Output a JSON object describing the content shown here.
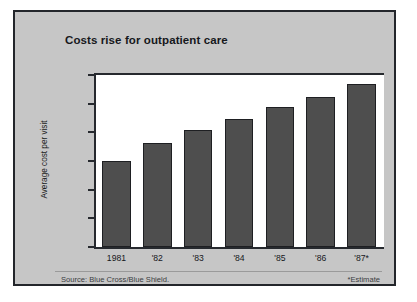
{
  "chart_data": {
    "type": "bar",
    "title": "Costs rise for outpatient care",
    "xlabel": "",
    "ylabel": "Average cost per visit",
    "categories": [
      "1981",
      "'82",
      "'83",
      "'84",
      "'85",
      "'86",
      "'87*"
    ],
    "values": [
      75,
      91,
      102,
      112,
      122,
      131,
      142
    ],
    "ylim": [
      0,
      150
    ],
    "yticks": [
      0,
      25,
      50,
      75,
      100,
      125,
      150
    ],
    "ytick_labels": [
      "0",
      "25",
      "50",
      "75",
      "100",
      "125",
      "150"
    ],
    "grid": false,
    "legend": "none",
    "series": [
      {
        "name": "Average cost per visit",
        "values": [
          75,
          91,
          102,
          112,
          122,
          131,
          142
        ]
      }
    ],
    "annotations": {
      "source": "Source: Blue Cross/Blue Shield.",
      "estimate": "*Estimate"
    },
    "colors": {
      "bar_fill": "#4e4e4e",
      "bar_edge": "#1e1f22",
      "panel_background": "#c6c6c6",
      "plot_background": "#ffffff",
      "axis": "#26292e",
      "text": "#15171b"
    }
  }
}
